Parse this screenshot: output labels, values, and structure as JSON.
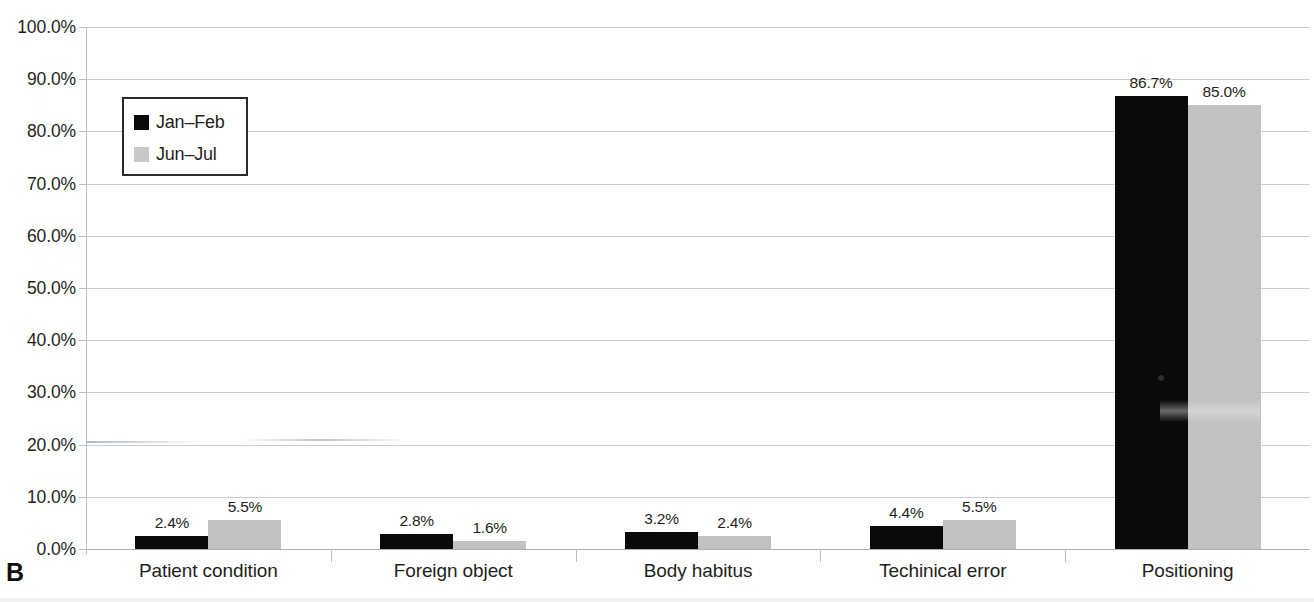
{
  "panel": {
    "letter": "B"
  },
  "title": {
    "text": ""
  },
  "legend": {
    "position": "inside-top-left",
    "entries": [
      {
        "label": "Jan–Feb",
        "color": "#0a0a0a"
      },
      {
        "label": "Jun–Jul",
        "color": "#c8c8c8"
      }
    ]
  },
  "yaxis": {
    "ticks": [
      "0.0%",
      "10.0%",
      "20.0%",
      "30.0%",
      "40.0%",
      "50.0%",
      "60.0%",
      "70.0%",
      "80.0%",
      "90.0%",
      "100.0%"
    ]
  },
  "chart_data": {
    "type": "bar",
    "title": "",
    "xlabel": "",
    "ylabel": "",
    "ylim": [
      0,
      100
    ],
    "ytick_step": 10,
    "yunit": "%",
    "grid": true,
    "legend_position": "inside-top-left",
    "categories": [
      "Patient condition",
      "Foreign object",
      "Body habitus",
      "Techinical error",
      "Positioning"
    ],
    "series": [
      {
        "name": "Jan–Feb",
        "color": "#0a0a0a",
        "values": [
          2.4,
          2.8,
          3.2,
          4.4,
          86.7
        ],
        "labels": [
          "2.4%",
          "2.8%",
          "3.2%",
          "4.4%",
          "86.7%"
        ]
      },
      {
        "name": "Jun–Jul",
        "color": "#c2c2c2",
        "values": [
          5.5,
          1.6,
          2.4,
          5.5,
          85.0
        ],
        "labels": [
          "5.5%",
          "1.6%",
          "2.4%",
          "5.5%",
          "85.0%"
        ]
      }
    ]
  },
  "colors": {
    "series_1": "#0a0a0a",
    "series_2": "#c2c2c2",
    "gridline": "#c8cdd2",
    "text": "#231f20",
    "background": "#ffffff"
  }
}
